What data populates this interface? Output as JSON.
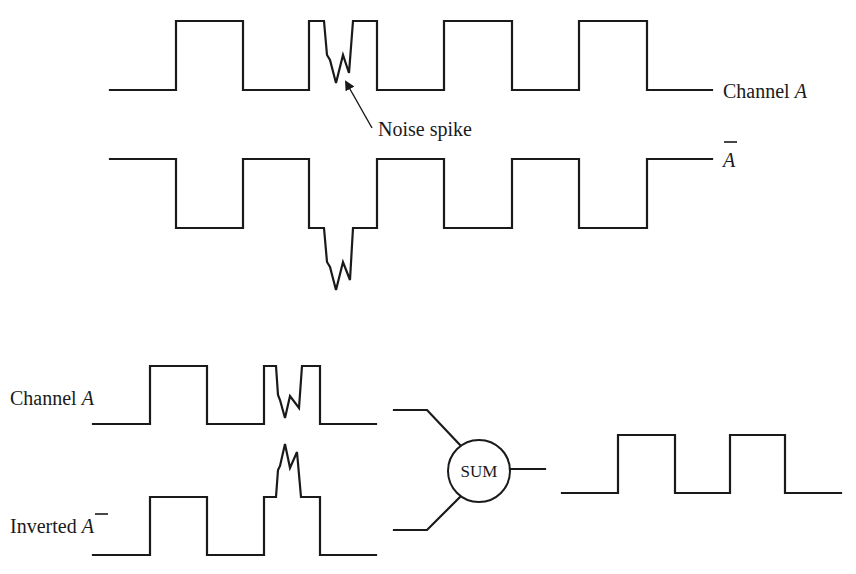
{
  "diagram": {
    "colors": {
      "ink": "#1a1a1a",
      "background": "#ffffff"
    },
    "top_section": {
      "channel_a": {
        "label_prefix": "Channel ",
        "label_var": "A",
        "points": "110,90 176,90 176,21 243,21 243,90 309,90 309,21 324,21 327,55 330,60 336,83 343,55 349,73 353,21 377,21 377,90 444,90 444,21 512,21 512,90 579,90 579,21 647,21 647,90 712,90"
      },
      "channel_a_bar": {
        "label_var": "A",
        "label_overbar": true,
        "points": "110,159 176,159 176,228 243,228 243,159 309,159 309,228 324,228 327,262 330,267 336,290 343,262 350,280 353,228 377,228 377,159 444,159 444,228 512,228 512,159 579,159 579,228 647,228 647,159 712,159"
      },
      "annotation": {
        "text": "Noise spike",
        "arrow_from": [
          372,
          128
        ],
        "arrow_to": [
          345,
          81
        ]
      }
    },
    "bottom_section": {
      "input_channel_a": {
        "label_prefix": "Channel ",
        "label_var": "A",
        "points": "93,424 150,424 150,366 207,366 207,424 264,424 264,366 276,366 278,395 280,400 285,418 290,396 299,408 302,366 320,366 320,424 376,424"
      },
      "input_inverted_a_bar": {
        "label_prefix": "Inverted ",
        "label_var": "A",
        "label_overbar": true,
        "points": "93,555 150,555 150,497 207,497 207,555 264,555 264,497 276,497 278,470 280,466 285,444 290,468 297,452 301,497 320,497 320,555 376,555"
      },
      "summer": {
        "label": "SUM",
        "center": [
          479,
          471
        ],
        "radius": 31,
        "input_top": "394,410 427,410 460,445",
        "input_bottom": "394,530 427,530 460,497",
        "output": "510,469 545,469"
      },
      "output_signal": {
        "points": "562,493 618,493 618,435 675,435 675,493 730,493 730,435 785,435 785,493 841,493"
      }
    }
  }
}
